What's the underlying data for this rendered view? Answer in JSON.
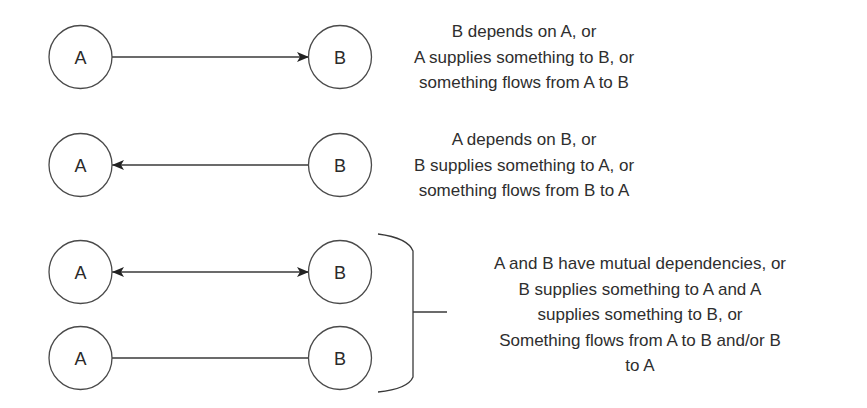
{
  "diagram": {
    "rows": [
      {
        "id": "row1",
        "left_node": "A",
        "right_node": "B",
        "edge": "arrow-right",
        "description": [
          "B depends on A, or",
          "A supplies something to B, or",
          "something flows from A to B"
        ]
      },
      {
        "id": "row2",
        "left_node": "A",
        "right_node": "B",
        "edge": "arrow-left",
        "description": [
          "A depends on B, or",
          "B supplies something to A, or",
          "something flows from B to A"
        ]
      },
      {
        "id": "row3",
        "left_node": "A",
        "right_node": "B",
        "edge": "arrow-both"
      },
      {
        "id": "row4",
        "left_node": "A",
        "right_node": "B",
        "edge": "line-plain"
      }
    ],
    "grouped_description": [
      "A and B have mutual dependencies, or",
      "B supplies something to A and A",
      "supplies something to B, or",
      "Something flows from A to B and/or B",
      "to A"
    ],
    "colors": {
      "stroke": "#3a3a3a",
      "text": "#2e2e2e",
      "background": "#ffffff"
    }
  }
}
